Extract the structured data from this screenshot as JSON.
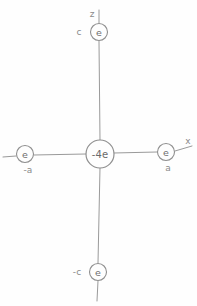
{
  "diagram": {
    "background_color": "#fefefe",
    "ink_color": "#8f8f8f",
    "axes": [
      {
        "id": "x-axis",
        "label": "x",
        "label_x": 188,
        "label_y": 141
      },
      {
        "id": "z-axis",
        "label": "z",
        "label_x": 92,
        "label_y": 14
      }
    ],
    "charges": [
      {
        "id": "charge-center",
        "label": "-4e",
        "position_label": "",
        "cx": 100,
        "cy": 154,
        "r": 14
      },
      {
        "id": "charge-top",
        "label": "e",
        "position_label": "c",
        "position_x": 79,
        "position_y": 32,
        "cx": 99,
        "cy": 32,
        "r": 8.5
      },
      {
        "id": "charge-bottom",
        "label": "e",
        "position_label": "-c",
        "position_x": 77,
        "position_y": 272,
        "cx": 98,
        "cy": 272,
        "r": 8.5
      },
      {
        "id": "charge-left",
        "label": "e",
        "position_label": "-a",
        "position_x": 28,
        "position_y": 170,
        "cx": 25,
        "cy": 154,
        "r": 8.5
      },
      {
        "id": "charge-right",
        "label": "e",
        "position_label": "a",
        "position_x": 168,
        "position_y": 168,
        "cx": 166,
        "cy": 152,
        "r": 8.5
      }
    ]
  }
}
